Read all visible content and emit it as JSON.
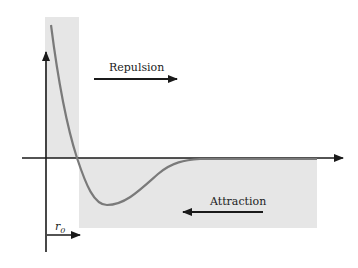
{
  "diagram": {
    "labels": {
      "repulsion": "Repulsion",
      "attraction": "Attraction",
      "r0_main": "r",
      "r0_sub": "0"
    },
    "colors": {
      "region_fill": "#e6e6e6",
      "curve": "#7a7a7a",
      "axis": "#1a1a1a",
      "arrow": "#1a1a1a"
    },
    "regions": [
      {
        "name": "repulsion-region",
        "description": "shaded region left of r0, above axis"
      },
      {
        "name": "attraction-region",
        "description": "shaded region right of r0, below axis"
      }
    ]
  }
}
